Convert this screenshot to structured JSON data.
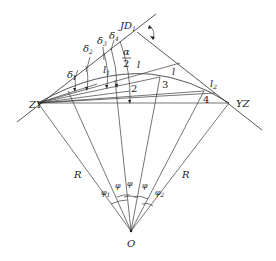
{
  "diagram": {
    "points": {
      "ZY": {
        "label": "ZY",
        "x": 38,
        "y": 103
      },
      "YZ": {
        "label": "YZ",
        "x": 229,
        "y": 103
      },
      "JD": {
        "label": "JD",
        "sub": "1",
        "x": 142,
        "y": 36
      },
      "O": {
        "label": "O",
        "x": 131,
        "y": 231
      },
      "P1": {
        "label": "1",
        "x": 97,
        "y": 84
      },
      "P2": {
        "label": "2",
        "x": 130,
        "y": 91
      },
      "P3": {
        "label": "3",
        "x": 160,
        "y": 77
      },
      "P4": {
        "label": "4",
        "x": 204,
        "y": 91
      }
    },
    "labels": {
      "zy": "ZY",
      "yz": "YZ",
      "jd": "JD",
      "jd_sub": "1",
      "o": "O",
      "r_left": "R",
      "r_right": "R",
      "delta1": "δ",
      "delta1_sub": "1",
      "delta2": "δ",
      "delta2_sub": "2",
      "delta3": "δ",
      "delta3_sub": "3",
      "delta4": "δ",
      "delta4_sub": "4",
      "alpha_num": "α",
      "alpha_den": "2",
      "l_mid": "l",
      "l1": "l",
      "l1_sub": "1",
      "l2": "l",
      "l2_sub": "2",
      "pt1": "1",
      "pt2": "2",
      "pt3": "3",
      "pt4": "4",
      "phi1": "φ",
      "phi1_sub": "1",
      "phi_a": "φ",
      "phi_b": "φ",
      "phi_c": "φ",
      "phi2": "φ",
      "phi2_sub": "2"
    }
  }
}
